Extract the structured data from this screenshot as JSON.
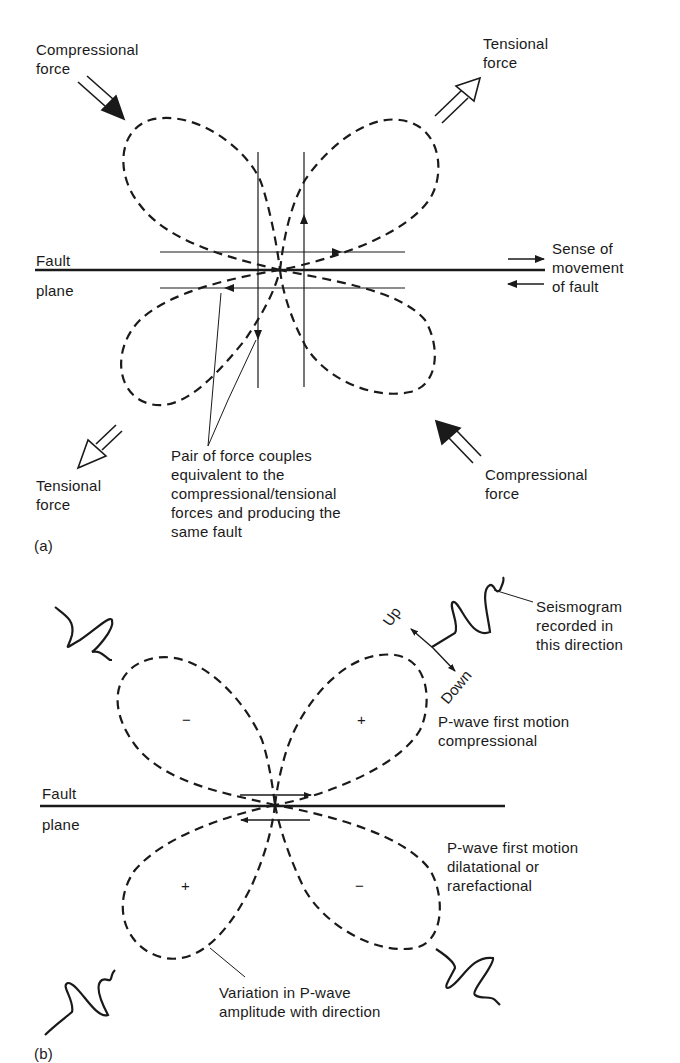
{
  "figure": {
    "panel_a": {
      "panel_label": "(a)",
      "labels": {
        "compressional_top_left": [
          "Compressional",
          "force"
        ],
        "tensional_top_right": [
          "Tensional",
          "force"
        ],
        "fault_plane": [
          "Fault",
          "plane"
        ],
        "sense_of_movement": [
          "Sense of",
          "movement",
          "of fault"
        ],
        "tensional_bottom_left": [
          "Tensional",
          "force"
        ],
        "force_couples": [
          "Pair of force couples",
          "equivalent to the",
          "compressional/tensional",
          "forces and producing the",
          "same fault"
        ],
        "compressional_bottom_right": [
          "Compressional",
          "force"
        ]
      }
    },
    "panel_b": {
      "panel_label": "(b)",
      "labels": {
        "seismogram": [
          "Seismogram",
          "recorded in",
          "this direction"
        ],
        "up": "Up",
        "down": "Down",
        "compressional_motion": [
          "P-wave first motion",
          "compressional"
        ],
        "fault_plane": [
          "Fault",
          "plane"
        ],
        "dilatational_motion": [
          "P-wave first motion",
          "dilatational or",
          "rarefactional"
        ],
        "amplitude_variation": [
          "Variation in P-wave",
          "amplitude with direction"
        ]
      },
      "quadrant_signs": {
        "upper_left": "−",
        "upper_right": "+",
        "lower_left": "+",
        "lower_right": "−"
      }
    },
    "colors": {
      "ink": "#1a1a1a",
      "background": "#ffffff"
    }
  }
}
